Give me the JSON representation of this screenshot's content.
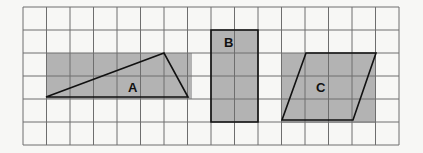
{
  "diagram": {
    "grid": {
      "left": 23,
      "top": 7,
      "cell_w": 23.5,
      "cell_h": 23,
      "cols": 16,
      "rows": 6,
      "line_color": "#6e6e6e"
    },
    "shade_color": "#b3b3b3",
    "shapes": [
      {
        "id": "A",
        "label": "A",
        "type": "triangle",
        "bounding_rect": {
          "x": 46,
          "y": 53,
          "w": 146,
          "h": 46
        },
        "points": [
          [
            46,
            97
          ],
          [
            164,
            53
          ],
          [
            188,
            97
          ]
        ],
        "label_pos": [
          128,
          92
        ]
      },
      {
        "id": "B",
        "label": "B",
        "type": "rectangle",
        "bounding_rect": {
          "x": 211,
          "y": 30,
          "w": 47,
          "h": 92
        },
        "points": [
          [
            211,
            30
          ],
          [
            258,
            30
          ],
          [
            258,
            122
          ],
          [
            211,
            122
          ]
        ],
        "label_pos": [
          224,
          47
        ]
      },
      {
        "id": "C",
        "label": "C",
        "type": "parallelogram",
        "bounding_rect": {
          "x": 281,
          "y": 53,
          "w": 95,
          "h": 70
        },
        "points": [
          [
            306,
            53
          ],
          [
            376,
            53
          ],
          [
            353,
            120
          ],
          [
            282,
            120
          ]
        ],
        "label_pos": [
          316,
          92
        ]
      }
    ]
  }
}
